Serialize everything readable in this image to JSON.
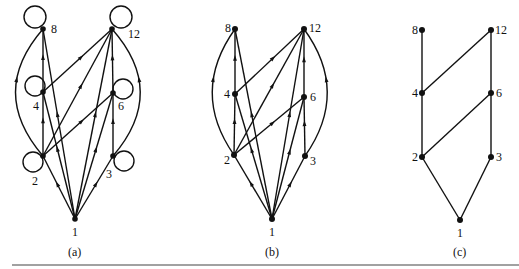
{
  "figure": {
    "subfigures": [
      {
        "id": "a",
        "caption": "(a)",
        "description": "Directed graph of divisibility relation on {1,2,3,4,6,8,12} with self-loops",
        "nodes": [
          {
            "label": "1",
            "x": 75,
            "y": 219,
            "lx": 72,
            "ly": 236
          },
          {
            "label": "2",
            "x": 43,
            "y": 156,
            "lx": 32,
            "ly": 185
          },
          {
            "label": "3",
            "x": 113,
            "y": 156,
            "lx": 106,
            "ly": 178
          },
          {
            "label": "4",
            "x": 43,
            "y": 92,
            "lx": 33,
            "ly": 110
          },
          {
            "label": "6",
            "x": 113,
            "y": 93,
            "lx": 118,
            "ly": 110
          },
          {
            "label": "8",
            "x": 43,
            "y": 29,
            "lx": 51,
            "ly": 33
          },
          {
            "label": "12",
            "x": 112,
            "y": 29,
            "lx": 128,
            "ly": 38
          }
        ],
        "loops": [
          {
            "node": "8",
            "cx": 35,
            "cy": 17,
            "r": 11
          },
          {
            "node": "12",
            "cx": 121,
            "cy": 17,
            "r": 11
          },
          {
            "node": "4",
            "cx": 35,
            "cy": 86,
            "r": 10
          },
          {
            "node": "6",
            "cx": 123,
            "cy": 89,
            "r": 10
          },
          {
            "node": "2",
            "cx": 33,
            "cy": 162,
            "r": 10
          },
          {
            "node": "3",
            "cx": 124,
            "cy": 161,
            "r": 10
          }
        ],
        "edges": [
          [
            "1",
            "2"
          ],
          [
            "1",
            "3"
          ],
          [
            "1",
            "4"
          ],
          [
            "1",
            "6"
          ],
          [
            "1",
            "8"
          ],
          [
            "1",
            "12"
          ],
          [
            "2",
            "4"
          ],
          [
            "2",
            "6"
          ],
          [
            "2",
            "12"
          ],
          [
            "3",
            "6"
          ],
          [
            "4",
            "8"
          ],
          [
            "4",
            "12"
          ],
          [
            "6",
            "12"
          ]
        ],
        "arcs": [
          {
            "from": "2",
            "to": "8",
            "ctrl_x": -12,
            "ctrl_y": 92
          },
          {
            "from": "3",
            "to": "12",
            "ctrl_x": 168,
            "ctrl_y": 92
          }
        ]
      },
      {
        "id": "b",
        "caption": "(b)",
        "description": "Same digraph with self-loops removed",
        "nodes": [
          {
            "label": "1",
            "x": 272,
            "y": 219,
            "lx": 269,
            "ly": 236
          },
          {
            "label": "2",
            "x": 234,
            "y": 155,
            "lx": 224,
            "ly": 164
          },
          {
            "label": "3",
            "x": 305,
            "y": 156,
            "lx": 310,
            "ly": 165
          },
          {
            "label": "4",
            "x": 235,
            "y": 94,
            "lx": 224,
            "ly": 98
          },
          {
            "label": "6",
            "x": 304,
            "y": 97,
            "lx": 310,
            "ly": 101
          },
          {
            "label": "8",
            "x": 235,
            "y": 29,
            "lx": 225,
            "ly": 32
          },
          {
            "label": "12",
            "x": 304,
            "y": 29,
            "lx": 309,
            "ly": 32
          }
        ],
        "edges": [
          [
            "1",
            "2"
          ],
          [
            "1",
            "3"
          ],
          [
            "1",
            "4"
          ],
          [
            "1",
            "6"
          ],
          [
            "1",
            "8"
          ],
          [
            "1",
            "12"
          ],
          [
            "2",
            "4"
          ],
          [
            "2",
            "6"
          ],
          [
            "2",
            "12"
          ],
          [
            "3",
            "6"
          ],
          [
            "4",
            "8"
          ],
          [
            "4",
            "12"
          ],
          [
            "6",
            "12"
          ]
        ],
        "arcs": [
          {
            "from": "2",
            "to": "8",
            "ctrl_x": 190,
            "ctrl_y": 92
          },
          {
            "from": "3",
            "to": "12",
            "ctrl_x": 350,
            "ctrl_y": 92
          }
        ]
      },
      {
        "id": "c",
        "caption": "(c)",
        "description": "Hasse diagram",
        "nodes": [
          {
            "label": "1",
            "x": 460,
            "y": 220,
            "lx": 457,
            "ly": 237
          },
          {
            "label": "2",
            "x": 422,
            "y": 157,
            "lx": 412,
            "ly": 161
          },
          {
            "label": "3",
            "x": 491,
            "y": 157,
            "lx": 496,
            "ly": 161
          },
          {
            "label": "4",
            "x": 422,
            "y": 93,
            "lx": 412,
            "ly": 97
          },
          {
            "label": "6",
            "x": 491,
            "y": 93,
            "lx": 496,
            "ly": 97
          },
          {
            "label": "8",
            "x": 422,
            "y": 30,
            "lx": 412,
            "ly": 34
          },
          {
            "label": "12",
            "x": 491,
            "y": 30,
            "lx": 495,
            "ly": 34
          }
        ],
        "edges": [
          [
            "1",
            "2"
          ],
          [
            "1",
            "3"
          ],
          [
            "2",
            "4"
          ],
          [
            "2",
            "6"
          ],
          [
            "3",
            "6"
          ],
          [
            "4",
            "8"
          ],
          [
            "4",
            "12"
          ],
          [
            "6",
            "12"
          ]
        ]
      }
    ],
    "captions": {
      "a": "(a)",
      "b": "(b)",
      "c": "(c)"
    },
    "caption_positions": {
      "a": [
        68,
        256
      ],
      "b": [
        265,
        256
      ],
      "c": [
        453,
        256
      ]
    },
    "rule": {
      "x1": 12,
      "x2": 519,
      "y": 265
    }
  }
}
